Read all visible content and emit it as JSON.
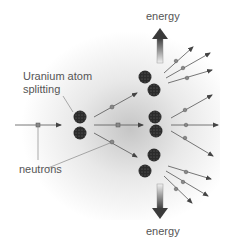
{
  "diagram": {
    "labels": {
      "uranium": "Uranium atom",
      "splitting": "splitting",
      "neutrons": "neutrons",
      "energy_top": "energy",
      "energy_bottom": "energy"
    },
    "colors": {
      "atom": "#2b2b2b",
      "arrow": "#555555",
      "neutron": "#888888",
      "text": "#555555",
      "glow": "#b4b4b4"
    },
    "atoms": [
      {
        "id": "primary-top",
        "x": 80,
        "y": 117
      },
      {
        "id": "primary-bottom",
        "x": 80,
        "y": 133
      },
      {
        "id": "secondary-top-a",
        "x": 145,
        "y": 77
      },
      {
        "id": "secondary-top-b",
        "x": 154,
        "y": 90
      },
      {
        "id": "secondary-mid-a",
        "x": 155,
        "y": 117
      },
      {
        "id": "secondary-mid-b",
        "x": 156,
        "y": 131
      },
      {
        "id": "secondary-bot-a",
        "x": 154,
        "y": 155
      },
      {
        "id": "secondary-bot-b",
        "x": 145,
        "y": 171
      }
    ]
  }
}
